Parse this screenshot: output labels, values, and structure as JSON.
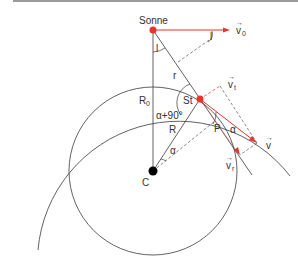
{
  "labels": {
    "sun": "Sonne",
    "v0": "v",
    "v0_sub": "0",
    "vt": "v",
    "vt_sub": "t",
    "v": "v",
    "vr": "v",
    "vr_sub": "r",
    "vec_arrow": "⃗",
    "angle_l_top": "l",
    "angle_l_right": "l",
    "r": "r",
    "R0": "R",
    "R0_sub": "0",
    "St": "St",
    "alpha_plus_90": "α+90°",
    "R": "R",
    "alpha_center": "α",
    "alpha_star": "α",
    "P": "P",
    "C": "C"
  },
  "colors": {
    "line": "#3a3a3a",
    "red": "#e8342a",
    "dash": "#555555",
    "border": "#9a9a9a"
  }
}
